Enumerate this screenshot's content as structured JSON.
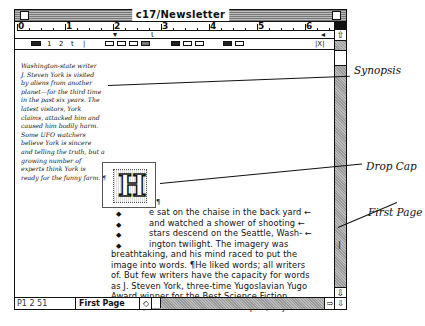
{
  "window": {
    "title": "c17/Newsletter"
  },
  "ruler": {
    "numbers": [
      "0",
      "1",
      "2",
      "3",
      "4",
      "5",
      "6"
    ]
  },
  "toolbar": {
    "spacing_items": [
      "1",
      "2",
      "t",
      "|"
    ],
    "close_label": "|X|"
  },
  "synopsis": {
    "lines": [
      "Washington-state writer",
      "J. Steven York is visited",
      "by aliens from another",
      "planet—for the third time",
      "in the past six years. The",
      "latest visitors, York",
      "claims, attacked him and",
      "caused him bodily harm.",
      "Some UFO watchers",
      "believe York is sincere",
      "and telling the truth, but a",
      "growing number of",
      "experts think York is",
      "ready for the funny farm. ¶"
    ]
  },
  "dropcap": {
    "letter": "H",
    "pilcrow": "¶"
  },
  "body": {
    "indented_lines": [
      "e sat on the chaise in the back yard ←",
      "and watched a shower of shooting ←",
      "stars descend on the Seattle, Wash- ←",
      "ington twilight. The imagery was"
    ],
    "full_lines": [
      "breathtaking, and his mind raced to put the",
      "image into words. ¶He liked words; all writers",
      "of. But few writers have the capacity for words",
      "as J. Steven York, three-time Yugoslavian Yugo",
      "Award winner for the Best Science Fiction",
      "Novel. ¶York rose to fetch a notepad, to jot"
    ]
  },
  "statusbar": {
    "page_number": "P1 2 51",
    "page_name": "First Page"
  },
  "annotations": {
    "synopsis": "Synopsis",
    "drop_cap": "Drop Cap",
    "first_page": "First Page"
  }
}
